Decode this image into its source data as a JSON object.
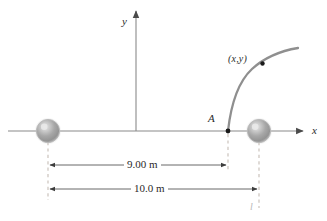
{
  "figure": {
    "background_color": "#ffffff"
  },
  "axes": {
    "x_label": "x",
    "y_label": "y",
    "axis_color": "#808080",
    "origin_x_px": 136,
    "origin_y_px": 131,
    "x_axis_start_px": 8,
    "x_axis_end_px": 308,
    "y_axis_top_px": 8
  },
  "points": [
    {
      "name": "point-A",
      "label": "A",
      "x_px": 228,
      "y_px": 131,
      "marker_color": "#1a1a1a"
    },
    {
      "name": "point-xy",
      "label": "(x,y)",
      "x_px": 263,
      "y_px": 64,
      "marker_color": "#1a1a1a"
    }
  ],
  "spheres": [
    {
      "name": "left-sphere",
      "center_x_px": 48,
      "center_y_px": 131,
      "radius_px": 12,
      "fill_color": "#a0a0a0",
      "highlight_color": "#dcdcdc",
      "edge_color": "#bdbdbd"
    },
    {
      "name": "right-sphere",
      "center_x_px": 259,
      "center_y_px": 131,
      "radius_px": 12,
      "fill_color": "#a0a0a0",
      "highlight_color": "#dcdcdc",
      "edge_color": "#bdbdbd"
    }
  ],
  "curve": {
    "name": "trajectory-curve",
    "color": "#8c8c8c",
    "width_px": 2.2,
    "start_px": [
      228,
      131
    ],
    "control_px": [
      247,
      73
    ],
    "end_px": [
      298,
      49
    ],
    "description": "curved path rising from point A to the upper right"
  },
  "dimensions": [
    {
      "name": "dimension-9m",
      "label": "9.00 m",
      "value": 9.0,
      "unit": "m",
      "from_px": 48,
      "to_px": 228,
      "y_px": 165,
      "color": "#555555"
    },
    {
      "name": "dimension-10m",
      "label": "10.0 m",
      "value": 10.0,
      "unit": "m",
      "from_px": 48,
      "to_px": 259,
      "y_px": 189,
      "color": "#555555"
    }
  ],
  "leader_lines": {
    "color": "#c2b9b2",
    "dash": "3 3",
    "items": [
      {
        "name": "leader-left-sphere",
        "x_px": 48,
        "from_y_px": 140,
        "to_y_px": 200
      },
      {
        "name": "leader-point-a",
        "x_px": 228,
        "from_y_px": 136,
        "to_y_px": 170
      },
      {
        "name": "leader-right-sphere",
        "x_px": 259,
        "from_y_px": 140,
        "to_y_px": 208
      }
    ]
  },
  "annotations": {
    "length_symbol": "l"
  }
}
